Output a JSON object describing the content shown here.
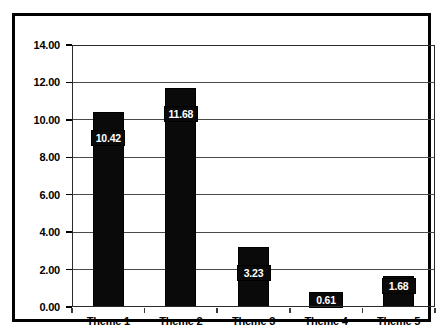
{
  "chart_data": {
    "type": "bar",
    "title": "",
    "subtitle": "",
    "xlabel": "",
    "ylabel": "",
    "categories": [
      "Theme 1",
      "Theme 2",
      "Theme 3",
      "Theme 4",
      "Theme 5"
    ],
    "values": [
      10.42,
      11.68,
      3.23,
      0.61,
      1.68
    ],
    "value_labels": [
      "10.42",
      "11.68",
      "3.23",
      "0.61",
      "1.68"
    ],
    "ylim": [
      0,
      14
    ],
    "ytick_values": [
      0,
      2,
      4,
      6,
      8,
      10,
      12,
      14
    ],
    "ytick_labels": [
      "0.00",
      "2.00",
      "4.00",
      "6.00",
      "8.00",
      "10.00",
      "12.00",
      "14.00"
    ],
    "grid": true,
    "grid_axis": "y",
    "legend": false,
    "legend_position": "none",
    "bar_color": "#0a0a0a",
    "value_label_color": "#ffffff",
    "plot_background": "#ffffff",
    "frame_color": "#000000",
    "gridline_color": "#4a4a4a"
  }
}
